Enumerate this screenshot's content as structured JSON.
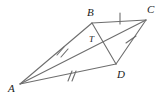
{
  "figure": {
    "background_color": "#ffffff",
    "stroke_color": "#6e6e6e",
    "label_color": "#1a1a1a",
    "labels": {
      "A": "A",
      "B": "B",
      "C": "C",
      "D": "D",
      "T": "T"
    },
    "label_positions": {
      "A": {
        "x": 8,
        "y": 92
      },
      "B": {
        "x": 87,
        "y": 16
      },
      "C": {
        "x": 147,
        "y": 13
      },
      "D": {
        "x": 117,
        "y": 78
      },
      "T": {
        "x": 89,
        "y": 42
      }
    },
    "vertices": {
      "A": {
        "x": 20,
        "y": 84
      },
      "B": {
        "x": 92,
        "y": 23
      },
      "C": {
        "x": 146,
        "y": 20
      },
      "D": {
        "x": 116,
        "y": 64
      },
      "T": {
        "x": 98,
        "y": 45
      }
    },
    "segments": [
      {
        "name": "AB",
        "from": "A",
        "to": "B",
        "ticks": 2
      },
      {
        "name": "BC",
        "from": "B",
        "to": "C",
        "ticks": 1
      },
      {
        "name": "CD",
        "from": "C",
        "to": "D",
        "ticks": 1
      },
      {
        "name": "DA",
        "from": "D",
        "to": "A",
        "ticks": 2
      },
      {
        "name": "AC",
        "from": "A",
        "to": "C",
        "ticks": 0
      },
      {
        "name": "BD",
        "from": "B",
        "to": "D",
        "ticks": 0
      }
    ],
    "tick_marks": [
      {
        "segment": "AB",
        "count": 2,
        "x": 61,
        "y": 51
      },
      {
        "segment": "DA",
        "count": 2,
        "x": 71,
        "y": 76
      },
      {
        "segment": "BC",
        "count": 1,
        "x": 120,
        "y": 18
      },
      {
        "segment": "CD",
        "count": 1,
        "x": 131,
        "y": 40
      }
    ]
  }
}
